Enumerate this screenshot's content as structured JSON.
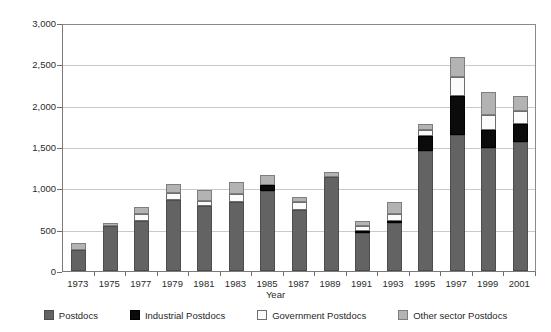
{
  "chart_data": {
    "type": "bar",
    "stacked": true,
    "title": "",
    "subtitle": "",
    "xlabel": "Year",
    "ylabel": "Number",
    "ylim": [
      0,
      3000
    ],
    "ytick_step": 500,
    "grid": true,
    "legend_position": "bottom",
    "categories": [
      "1973",
      "1975",
      "1977",
      "1979",
      "1981",
      "1983",
      "1985",
      "1987",
      "1989",
      "1991",
      "1993",
      "1995",
      "1997",
      "1999",
      "2001"
    ],
    "series": [
      {
        "name": "Postdocs",
        "color": "#636363",
        "values": [
          250,
          545,
          610,
          865,
          790,
          835,
          970,
          735,
          1135,
          465,
          580,
          1450,
          1640,
          1490,
          1560
        ]
      },
      {
        "name": "Industrial Postdocs",
        "color": "#0b0b0b",
        "values": [
          0,
          0,
          0,
          0,
          0,
          0,
          65,
          0,
          0,
          25,
          25,
          185,
          475,
          215,
          220
        ]
      },
      {
        "name": "Government Postdocs",
        "color": "#fbfbfb",
        "values": [
          0,
          0,
          75,
          75,
          55,
          100,
          0,
          95,
          0,
          60,
          80,
          75,
          230,
          185,
          155
        ]
      },
      {
        "name": "Other sector Postdocs",
        "color": "#b3b3b3",
        "values": [
          90,
          35,
          90,
          115,
          140,
          140,
          130,
          60,
          65,
          50,
          145,
          65,
          250,
          280,
          185
        ]
      }
    ],
    "totals": [
      340,
      580,
      775,
      1055,
      985,
      1075,
      1165,
      890,
      1200,
      600,
      830,
      1775,
      2595,
      2170,
      2120
    ],
    "ytick_labels": [
      "0",
      "500",
      "1,000",
      "1,500",
      "2,000",
      "2,500",
      "3,000"
    ],
    "ytick_values": [
      0,
      500,
      1000,
      1500,
      2000,
      2500,
      3000
    ]
  },
  "legend": {
    "items": [
      {
        "label": "Postdocs"
      },
      {
        "label": "Industrial Postdocs"
      },
      {
        "label": "Government Postdocs"
      },
      {
        "label": "Other sector Postdocs"
      }
    ]
  }
}
